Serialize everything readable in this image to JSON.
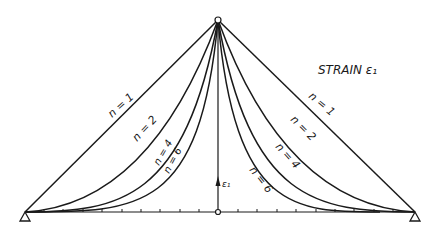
{
  "title": "STRAIN ε₁",
  "axis_label": "ε₁",
  "colors": {
    "ink": "#1a1a1a",
    "background": "#ffffff"
  },
  "curves": {
    "left": [
      {
        "n": 1,
        "label": "n = 1"
      },
      {
        "n": 2,
        "label": "n = 2"
      },
      {
        "n": 4,
        "label": "n = 4"
      },
      {
        "n": 6,
        "label": "n = 6"
      }
    ],
    "right": [
      {
        "n": 1,
        "label": "n = 1"
      },
      {
        "n": 2,
        "label": "n = 2"
      },
      {
        "n": 4,
        "label": "n = 4"
      },
      {
        "n": 6,
        "label": "n = 6"
      }
    ]
  },
  "supports": {
    "left": "triangle-support",
    "right": "triangle-support"
  }
}
